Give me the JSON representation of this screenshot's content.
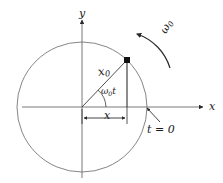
{
  "figure": {
    "colors": {
      "stroke": "#3b3b3b",
      "circle": "#6e6e6e",
      "axis": "#6e6e6e",
      "text": "#1a1a1a",
      "background": "#ffffff"
    },
    "axes": {
      "y_label": "y",
      "x_label": "x",
      "origin": {
        "x": 82,
        "y": 107
      }
    },
    "circle": {
      "center_x": 82,
      "center_y": 107,
      "radius": 65
    },
    "labels": {
      "radius_vector": "x",
      "radius_vector_sub": "0",
      "angle": "ω",
      "angle_sub": "0",
      "angle_tail": "t",
      "projection": "x",
      "angular_velocity": "ω",
      "angular_velocity_sub": "0",
      "time_zero": "t = 0"
    },
    "point": {
      "x": 127,
      "y": 60,
      "angle_deg": 46
    },
    "projection_segment": {
      "from_x": 82,
      "to_x": 127,
      "y": 118
    }
  }
}
